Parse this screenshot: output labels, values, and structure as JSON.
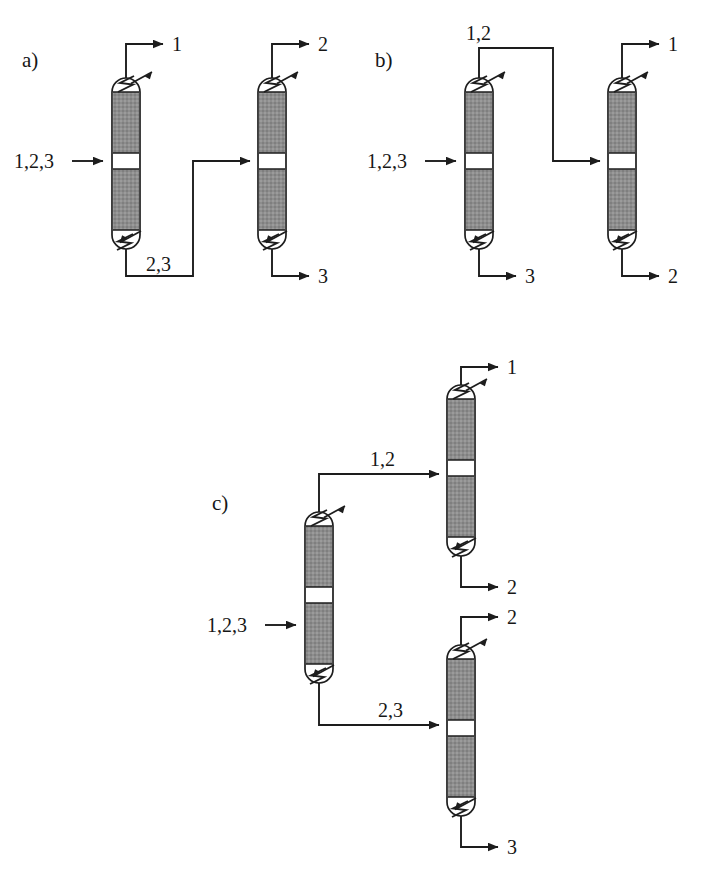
{
  "figure": {
    "background_color": "#ffffff",
    "line_color": "#1d1d1d",
    "packing_color": "#8a8a8a",
    "shell_fill": "#ffffff"
  },
  "panels": [
    {
      "id": "a",
      "label": "a)",
      "description": "Direct sequence: component 1 removed overhead in column 1, bottoms 2,3 fed to column 2",
      "columns": [
        {
          "id": "a-col-1",
          "name": "column-1",
          "feeds": [
            {
              "label": "1,2,3",
              "port": "side"
            }
          ],
          "overhead": {
            "label": "1"
          },
          "bottoms": {
            "label": "2,3"
          },
          "condenser": "heat-exchanger-out",
          "reboiler": "heat-exchanger-in"
        },
        {
          "id": "a-col-2",
          "name": "column-2",
          "feeds": [
            {
              "label": "2,3",
              "port": "side"
            }
          ],
          "overhead": {
            "label": "2"
          },
          "bottoms": {
            "label": "3"
          },
          "condenser": "heat-exchanger-out",
          "reboiler": "heat-exchanger-in"
        }
      ],
      "stream_labels": [
        "1",
        "2",
        "3",
        "1,2,3",
        "2,3"
      ]
    },
    {
      "id": "b",
      "label": "b)",
      "description": "Indirect sequence: component 3 removed as bottoms in column 1, overhead 1,2 fed to column 2",
      "columns": [
        {
          "id": "b-col-1",
          "name": "column-1",
          "feeds": [
            {
              "label": "1,2,3",
              "port": "side"
            }
          ],
          "overhead": {
            "label": "1,2"
          },
          "bottoms": {
            "label": "3"
          },
          "condenser": "heat-exchanger-out",
          "reboiler": "heat-exchanger-in"
        },
        {
          "id": "b-col-2",
          "name": "column-2",
          "feeds": [
            {
              "label": "1,2",
              "port": "side"
            }
          ],
          "overhead": {
            "label": "1"
          },
          "bottoms": {
            "label": "2"
          },
          "condenser": "heat-exchanger-out",
          "reboiler": "heat-exchanger-in"
        }
      ],
      "stream_labels": [
        "1,2",
        "1",
        "1,2,3",
        "3",
        "2"
      ]
    },
    {
      "id": "c",
      "label": "c)",
      "description": "Prefractionator-type arrangement: first column splits into 1,2 overhead and 2,3 bottoms feeding two downstream columns",
      "columns": [
        {
          "id": "c-col-1",
          "name": "prefractionator-column",
          "feeds": [
            {
              "label": "1,2,3",
              "port": "side"
            }
          ],
          "overhead": {
            "label": "1,2"
          },
          "bottoms": {
            "label": "2,3"
          },
          "condenser": "heat-exchanger-out",
          "reboiler": "heat-exchanger-in"
        },
        {
          "id": "c-col-2",
          "name": "upper-column",
          "feeds": [
            {
              "label": "1,2",
              "port": "side"
            }
          ],
          "overhead": {
            "label": "1"
          },
          "bottoms": {
            "label": "2"
          },
          "condenser": "heat-exchanger-out",
          "reboiler": "heat-exchanger-in"
        },
        {
          "id": "c-col-3",
          "name": "lower-column",
          "feeds": [
            {
              "label": "2,3",
              "port": "side"
            }
          ],
          "overhead": {
            "label": "2"
          },
          "bottoms": {
            "label": "3"
          },
          "condenser": "heat-exchanger-out",
          "reboiler": "heat-exchanger-in"
        }
      ],
      "stream_labels": [
        "1",
        "1,2",
        "1,2,3",
        "2",
        "2",
        "2,3",
        "3"
      ]
    }
  ],
  "labels": {
    "panel_a": "a)",
    "panel_b": "b)",
    "panel_c": "c)",
    "a_feed": "1,2,3",
    "a_c1_top": "1",
    "a_c1_bottom": "2,3",
    "a_c2_top": "2",
    "a_c2_bottom": "3",
    "b_feed": "1,2,3",
    "b_c1_top": "1,2",
    "b_c1_bottom": "3",
    "b_c2_top": "1",
    "b_c2_bottom": "2",
    "c_feed": "1,2,3",
    "c_c1_top": "1,2",
    "c_c1_bottom": "2,3",
    "c_c2_top": "1",
    "c_c2_bottom": "2",
    "c_c3_top": "2",
    "c_c3_bottom": "3"
  }
}
